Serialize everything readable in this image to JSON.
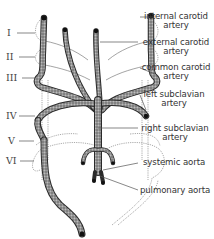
{
  "diagram": {
    "type": "anatomical-diagram",
    "arch_numerals": [
      "I",
      "II",
      "III",
      "IV",
      "V",
      "VI"
    ],
    "labels": {
      "internal_carotid": [
        "internal carotid",
        "artery"
      ],
      "external_carotid": [
        "external carotid",
        "artery"
      ],
      "common_carotid": [
        "common carotid",
        "artery"
      ],
      "left_subclavian": [
        "left subclavian",
        "artery"
      ],
      "right_subclavian": [
        "right subclavian",
        "artery"
      ],
      "systemic_aorta": "systemic aorta",
      "pulmonary_aorta": "pulmonary aorta"
    },
    "colors": {
      "vessel_fill": "#8a8a8a",
      "vessel_outline": "#2a2a2a",
      "dotted_outline": "#777777",
      "leader_line": "#555555",
      "text": "#333333"
    }
  }
}
